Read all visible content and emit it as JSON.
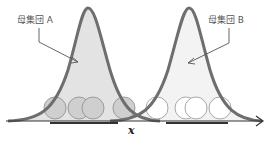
{
  "diagram": {
    "population_a_label": "母集団 A",
    "population_b_label": "母集団 B",
    "x_axis_label": "x",
    "colors": {
      "curve": "#6e6e6e",
      "fill_a": "#e3e3e3",
      "fill_b": "#f3f3f3",
      "sample_a_fill": "#cfcfcf",
      "sample_a_stroke": "#9a9a9a",
      "sample_b_fill": "#ffffff",
      "sample_b_stroke": "#a8a8a8",
      "axis": "#333333"
    },
    "samples_a_count": 4,
    "samples_b_count": 4
  }
}
